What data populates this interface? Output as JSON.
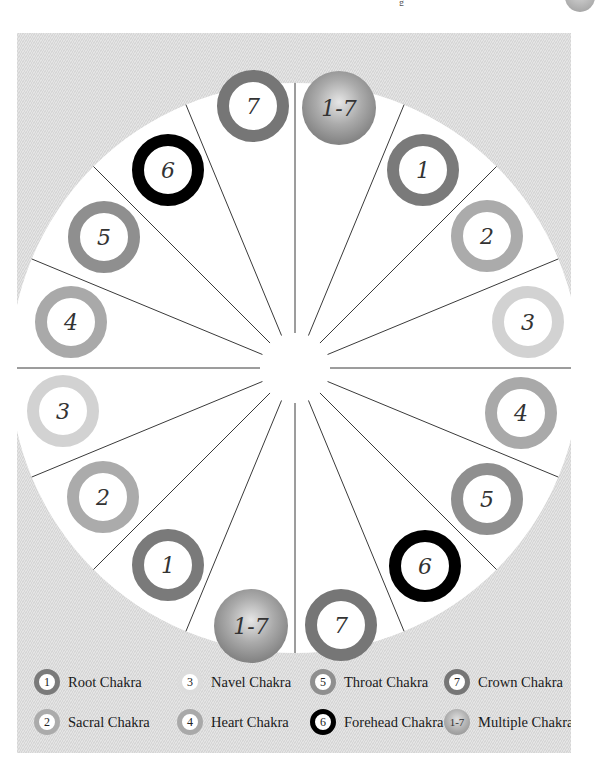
{
  "page": {
    "header_fragment": "g",
    "background": "#ffffff"
  },
  "diagram": {
    "title": "",
    "type": "chakra-wheel",
    "center": [
      278,
      335
    ],
    "outer_radius": 285,
    "inner_radius": 35,
    "sectors_count": 16,
    "colors": {
      "panel": "#dcdcdc",
      "wheel_fill": "#ffffff",
      "divider": "#3a3a3a",
      "ring_1": "#7a7a7a",
      "ring_2": "#ababab",
      "ring_3": "#d2d2d2",
      "ring_4": "#a9a9a9",
      "ring_5": "#8f8f8f",
      "ring_6": "#000000",
      "ring_7": "#767676",
      "multi_inner": "#e4e4e4",
      "multi_outer": "#8a8a8a"
    },
    "markers": [
      {
        "label": "1-7",
        "chakra": "multi",
        "x": 322,
        "y": 75
      },
      {
        "label": "1",
        "chakra": "1",
        "x": 406,
        "y": 137
      },
      {
        "label": "2",
        "chakra": "2",
        "x": 470,
        "y": 203
      },
      {
        "label": "3",
        "chakra": "3",
        "x": 511,
        "y": 289
      },
      {
        "label": "4",
        "chakra": "4",
        "x": 504,
        "y": 380
      },
      {
        "label": "5",
        "chakra": "5",
        "x": 470,
        "y": 466
      },
      {
        "label": "6",
        "chakra": "6",
        "x": 408,
        "y": 533
      },
      {
        "label": "7",
        "chakra": "7",
        "x": 324,
        "y": 592
      },
      {
        "label": "1-7",
        "chakra": "multi",
        "x": 234,
        "y": 593
      },
      {
        "label": "1",
        "chakra": "1",
        "x": 151,
        "y": 532
      },
      {
        "label": "2",
        "chakra": "2",
        "x": 86,
        "y": 464
      },
      {
        "label": "3",
        "chakra": "3",
        "x": 46,
        "y": 378
      },
      {
        "label": "4",
        "chakra": "4",
        "x": 54,
        "y": 289
      },
      {
        "label": "5",
        "chakra": "5",
        "x": 87,
        "y": 204
      },
      {
        "label": "6",
        "chakra": "6",
        "x": 151,
        "y": 137
      },
      {
        "label": "7",
        "chakra": "7",
        "x": 236,
        "y": 73
      }
    ]
  },
  "legend": {
    "items": [
      {
        "number": "1",
        "label": "Root Chakra"
      },
      {
        "number": "2",
        "label": "Sacral Chakra"
      },
      {
        "number": "3",
        "label": "Navel Chakra"
      },
      {
        "number": "4",
        "label": "Heart Chakra"
      },
      {
        "number": "5",
        "label": "Throat Chakra"
      },
      {
        "number": "6",
        "label": "Forehead Chakra"
      },
      {
        "number": "7",
        "label": "Crown Chakra"
      },
      {
        "number": "1-7",
        "label": "Multiple Chakras"
      }
    ]
  }
}
